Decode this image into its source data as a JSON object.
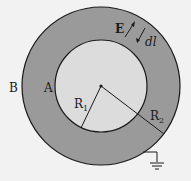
{
  "diagram": {
    "colors": {
      "background": "#f2f2f2",
      "shell_fill": "#9a9a9a",
      "inner_fill": "#dcdcdc",
      "stroke": "#1a1a1a"
    },
    "geometry": {
      "center": [
        101,
        86
      ],
      "outer_radius": 79,
      "inner_radius": 46
    },
    "labels": {
      "outer_surface": "B",
      "inner_surface": "A",
      "inner_radius": "R",
      "inner_radius_sub": "1",
      "outer_radius": "R",
      "outer_radius_sub": "2",
      "field": "E",
      "displacement": "dl"
    },
    "annotations": {
      "field_arrow": "E points outward",
      "dl_arrow": "dl points inward",
      "ground": "outer shell grounded"
    }
  }
}
